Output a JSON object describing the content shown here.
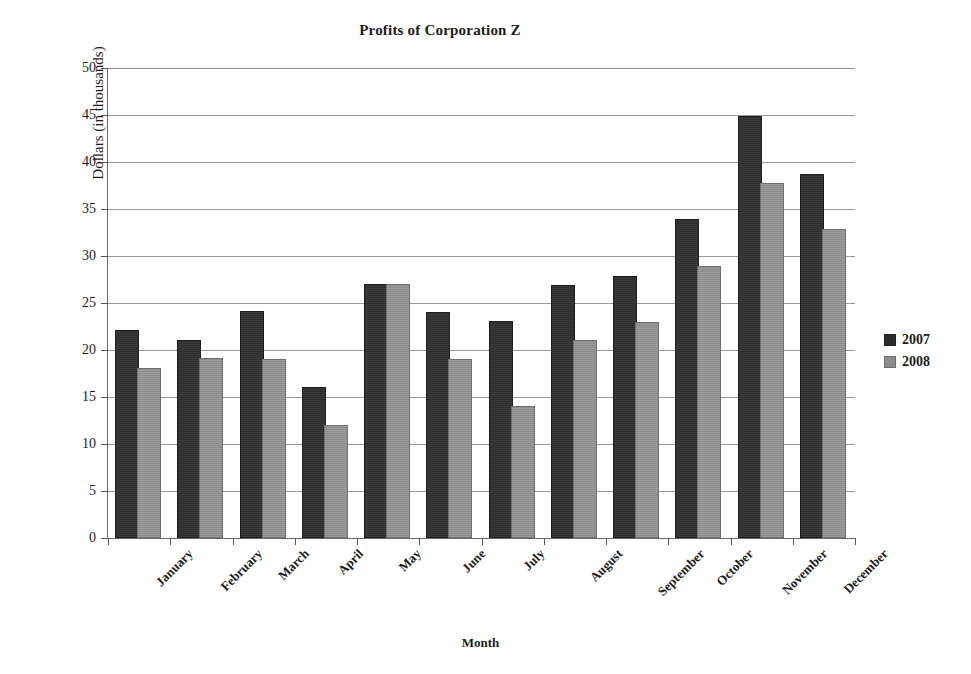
{
  "chart_data": {
    "type": "bar",
    "title": "Profits of Corporation Z",
    "xlabel": "Month",
    "ylabel": "Dollars (in thousands)",
    "ylim": [
      0,
      50
    ],
    "ytick_step": 5,
    "yticks": [
      "0",
      "5",
      "10",
      "15",
      "20",
      "25",
      "30",
      "35",
      "40",
      "45",
      "50"
    ],
    "grid": true,
    "legend_position": "right",
    "categories": [
      "January",
      "February",
      "March",
      "April",
      "May",
      "June",
      "July",
      "August",
      "September",
      "October",
      "November",
      "December"
    ],
    "series": [
      {
        "name": "2007",
        "color": "#2f2f2f",
        "values": [
          21.9,
          20.9,
          23.9,
          15.9,
          26.8,
          23.8,
          22.9,
          26.7,
          27.7,
          33.7,
          44.7,
          38.5
        ]
      },
      {
        "name": "2008",
        "color": "#8d8d8d",
        "values": [
          17.9,
          18.9,
          18.8,
          11.8,
          26.8,
          18.8,
          13.8,
          20.8,
          22.8,
          28.7,
          37.6,
          32.7
        ]
      }
    ]
  },
  "legend": {
    "items": [
      {
        "label": "2007"
      },
      {
        "label": "2008"
      }
    ]
  }
}
